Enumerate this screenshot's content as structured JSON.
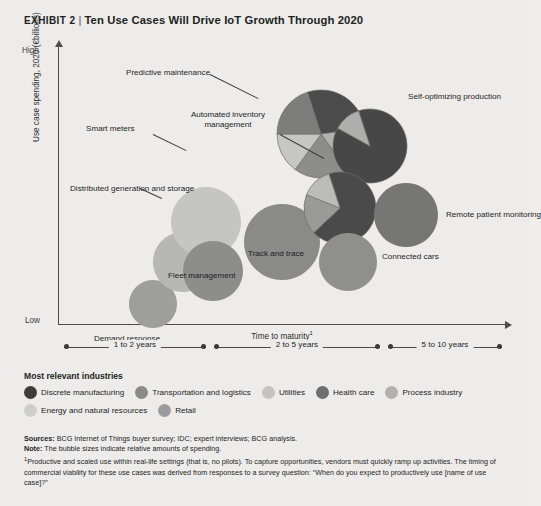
{
  "header": {
    "exhibit": "EXHIBIT 2",
    "separator": "|",
    "title": "Ten Use Cases Will Drive IoT Growth Through 2020"
  },
  "axes": {
    "y_label": "Use case spending, 2020 (€billions)",
    "y_high": "High",
    "y_low": "Low",
    "x_label": "Time to maturity",
    "x_label_footnote": "1"
  },
  "maturity_bands": [
    {
      "label": "1 to 2 years"
    },
    {
      "label": "2 to 5 years"
    },
    {
      "label": "5 to 10 years"
    }
  ],
  "legend": {
    "title": "Most relevant industries",
    "items": [
      {
        "label": "Discrete manufacturing",
        "color": "#3c3c3c"
      },
      {
        "label": "Transportation and logistics",
        "color": "#8a8a8a"
      },
      {
        "label": "Utilities",
        "color": "#c3c3c0"
      },
      {
        "label": "Health care",
        "color": "#6e6e6e"
      },
      {
        "label": "Process industry",
        "color": "#b0b0ae"
      },
      {
        "label": "Energy and natural resources",
        "color": "#cdcdca"
      },
      {
        "label": "Retail",
        "color": "#9b9b9b"
      }
    ]
  },
  "notes": {
    "sources_label": "Sources:",
    "sources_text": "BCG Internet of Things buyer survey; IDC; expert interviews; BCG analysis.",
    "note_label": "Note:",
    "note_text": "The bubble sizes indicate relative amounts of spending.",
    "footnote_marker": "1",
    "footnote_text": "Productive and scaled use within real-life settings (that is, no pilots). To capture opportunities, vendors must quickly ramp up activities. The timing of commercial viability for these use cases was derived from responses to a survey question: “When do you expect to productively use [name of use case]?”"
  },
  "chart_data": {
    "type": "scatter",
    "title": "Ten Use Cases Will Drive IoT Growth Through 2020",
    "xlabel": "Time to maturity",
    "ylabel": "Use case spending, 2020 (€billions)",
    "xlim": [
      "1 to 2 years",
      "5 to 10 years"
    ],
    "ylim": [
      "Low",
      "High"
    ],
    "grid": false,
    "legend_position": "below-plot",
    "note": "Bubble area encodes relative use case spending; bubble wedges encode share of most relevant industries.",
    "bubbles": [
      {
        "label": "Demand response",
        "x_px": 95,
        "y_px": 258,
        "r_px": 24,
        "maturity_band": "1 to 2 years",
        "spending_rank": 10,
        "slices": [
          {
            "industry": "Energy and natural resources",
            "share": 100,
            "color": "#9e9e9c"
          }
        ]
      },
      {
        "label": "Distributed generation and storage",
        "x_px": 125,
        "y_px": 216,
        "r_px": 30,
        "maturity_band": "1 to 2 years",
        "spending_rank": 8,
        "slices": [
          {
            "industry": "Utilities",
            "share": 100,
            "color": "#b7b7b4"
          }
        ]
      },
      {
        "label": "Smart meters",
        "x_px": 148,
        "y_px": 176,
        "r_px": 35,
        "maturity_band": "1 to 2 years",
        "spending_rank": 5,
        "slices": [
          {
            "industry": "Utilities",
            "share": 100,
            "color": "#c5c5c1"
          }
        ]
      },
      {
        "label": "Fleet management",
        "x_px": 155,
        "y_px": 225,
        "r_px": 30,
        "maturity_band": "1 to 2 years",
        "spending_rank": 7,
        "slices": [
          {
            "industry": "Transportation and logistics",
            "share": 100,
            "color": "#8d8d8b"
          }
        ]
      },
      {
        "label": "Track and trace",
        "x_px": 224,
        "y_px": 196,
        "r_px": 38,
        "maturity_band": "2 to 5 years",
        "spending_rank": 4,
        "slices": [
          {
            "industry": "Transportation and logistics",
            "share": 100,
            "color": "#8a8a88"
          }
        ]
      },
      {
        "label": "Predictive maintenance",
        "x_px": 263,
        "y_px": 88,
        "r_px": 44,
        "maturity_band": "2 to 5 years",
        "spending_rank": 1,
        "slices": [
          {
            "industry": "Discrete manufacturing",
            "share": 28,
            "color": "#4b4b4b"
          },
          {
            "industry": "Process industry",
            "share": 17,
            "color": "#b2b2b0"
          },
          {
            "industry": "Transportation and logistics",
            "share": 20,
            "color": "#8d8d8b"
          },
          {
            "industry": "Utilities",
            "share": 15,
            "color": "#c6c6c2"
          },
          {
            "industry": "Energy and natural resources",
            "share": 20,
            "color": "#7d7d7b"
          }
        ]
      },
      {
        "label": "Self-optimizing production",
        "x_px": 312,
        "y_px": 100,
        "r_px": 37,
        "maturity_band": "2 to 5 years",
        "spending_rank": 3,
        "slices": [
          {
            "industry": "Discrete manufacturing",
            "share": 88,
            "color": "#474747"
          },
          {
            "industry": "Process industry",
            "share": 12,
            "color": "#aeaeac"
          }
        ]
      },
      {
        "label": "Automated inventory management",
        "x_px": 282,
        "y_px": 162,
        "r_px": 36,
        "maturity_band": "2 to 5 years",
        "spending_rank": 2,
        "slices": [
          {
            "industry": "Discrete manufacturing",
            "share": 68,
            "color": "#4a4a4a"
          },
          {
            "industry": "Retail",
            "share": 18,
            "color": "#9a9a98"
          },
          {
            "industry": "Process industry",
            "share": 14,
            "color": "#bcbcb9"
          }
        ]
      },
      {
        "label": "Connected cars",
        "x_px": 290,
        "y_px": 216,
        "r_px": 29,
        "maturity_band": "2 to 5 years",
        "spending_rank": 9,
        "slices": [
          {
            "industry": "Transportation and logistics",
            "share": 100,
            "color": "#8f8f8d"
          }
        ]
      },
      {
        "label": "Remote patient monitoring",
        "x_px": 348,
        "y_px": 169,
        "r_px": 32,
        "maturity_band": "2 to 5 years",
        "spending_rank": 6,
        "slices": [
          {
            "industry": "Health care",
            "share": 100,
            "color": "#767674"
          }
        ]
      }
    ]
  }
}
